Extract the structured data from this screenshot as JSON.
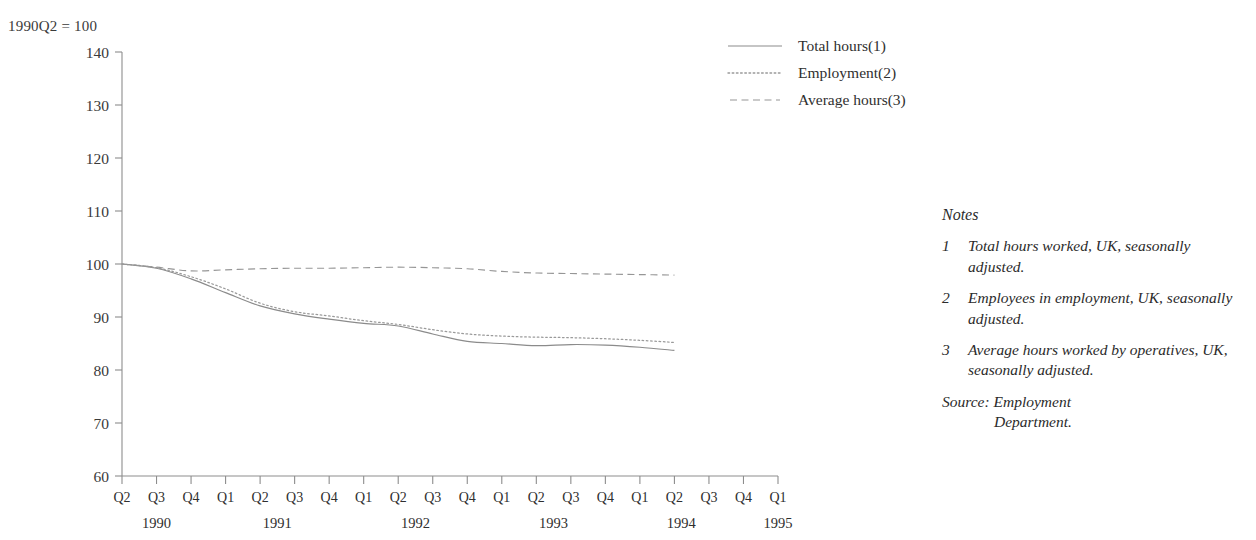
{
  "index_note": "1990Q2 = 100",
  "legend": {
    "items": [
      {
        "label": "Total hours(1)",
        "style": "solid",
        "icon": "solid-line-icon"
      },
      {
        "label": "Employment(2)",
        "style": "dotted",
        "icon": "dotted-line-icon"
      },
      {
        "label": "Average hours(3)",
        "style": "dashed",
        "icon": "dashed-line-icon"
      }
    ]
  },
  "notes": {
    "heading": "Notes",
    "items": [
      {
        "num": "1",
        "text": "Total hours worked, UK, seasonally adjusted."
      },
      {
        "num": "2",
        "text": "Employees in employment, UK, seasonally adjusted."
      },
      {
        "num": "3",
        "text": "Average hours worked by operatives, UK, seasonally adjusted."
      }
    ],
    "source_label": "Source: Employment",
    "source_cont": "Department."
  },
  "chart_data": {
    "type": "line",
    "title": "",
    "xlabel": "",
    "ylabel": "",
    "index_base": "1990Q2 = 100",
    "grid": false,
    "legend_position": "top-right",
    "ylim": [
      60,
      140
    ],
    "yticks": [
      60,
      70,
      80,
      90,
      100,
      110,
      120,
      130,
      140
    ],
    "x": [
      "1990Q2",
      "1990Q3",
      "1990Q4",
      "1991Q1",
      "1991Q2",
      "1991Q3",
      "1991Q4",
      "1992Q1",
      "1992Q2",
      "1992Q3",
      "1992Q4",
      "1993Q1",
      "1993Q2",
      "1993Q3",
      "1993Q4",
      "1994Q1",
      "1994Q2",
      "1994Q3",
      "1994Q4",
      "1995Q1"
    ],
    "xtick_labels": [
      "Q2",
      "Q3",
      "Q4",
      "Q1",
      "Q2",
      "Q3",
      "Q4",
      "Q1",
      "Q2",
      "Q3",
      "Q4",
      "Q1",
      "Q2",
      "Q3",
      "Q4",
      "Q1",
      "Q2",
      "Q3",
      "Q4",
      "Q1"
    ],
    "year_labels": [
      {
        "year": "1990",
        "tick_index": 1
      },
      {
        "year": "1991",
        "tick_index": 4.5
      },
      {
        "year": "1992",
        "tick_index": 8.5
      },
      {
        "year": "1993",
        "tick_index": 12.5
      },
      {
        "year": "1994",
        "tick_index": 16.2
      },
      {
        "year": "1995",
        "tick_index": 19
      }
    ],
    "series": [
      {
        "name": "Total hours(1)",
        "style": "solid",
        "values": [
          100.0,
          99.2,
          97.2,
          94.6,
          92.1,
          90.6,
          89.6,
          88.8,
          88.3,
          86.8,
          85.4,
          85.0,
          84.6,
          84.8,
          84.7,
          84.3,
          83.7,
          null,
          null,
          null
        ]
      },
      {
        "name": "Employment(2)",
        "style": "dotted",
        "values": [
          100.0,
          99.3,
          97.6,
          95.3,
          92.6,
          91.0,
          90.2,
          89.3,
          88.6,
          87.6,
          86.8,
          86.4,
          86.2,
          86.1,
          85.9,
          85.6,
          85.2,
          null,
          null,
          null
        ]
      },
      {
        "name": "Average hours(3)",
        "style": "dashed",
        "values": [
          100.0,
          99.4,
          98.7,
          98.9,
          99.1,
          99.2,
          99.2,
          99.3,
          99.4,
          99.3,
          99.1,
          98.6,
          98.3,
          98.2,
          98.1,
          98.0,
          97.9,
          null,
          null,
          null
        ]
      }
    ]
  }
}
